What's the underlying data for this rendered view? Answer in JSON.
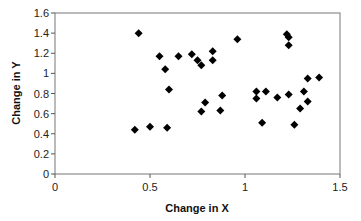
{
  "chart_data": {
    "type": "scatter",
    "title": "",
    "xlabel": "Change in X",
    "ylabel": "Change in Y",
    "xlim": [
      0,
      1.5
    ],
    "ylim": [
      0,
      1.6
    ],
    "xticks": [
      0,
      0.5,
      1,
      1.5
    ],
    "xtick_labels": [
      "0",
      "0.5",
      "1",
      "1.5"
    ],
    "yticks": [
      0,
      0.2,
      0.4,
      0.6,
      0.8,
      1.0,
      1.2,
      1.4,
      1.6
    ],
    "ytick_labels": [
      "0",
      "0.2",
      "0.4",
      "0.6",
      "0.8",
      "1",
      "1.2",
      "1.4",
      "1.6"
    ],
    "grid": false,
    "legend": null,
    "marker": "diamond",
    "marker_color": "#000000",
    "series": [
      {
        "name": "Change",
        "points": [
          [
            0.44,
            1.4
          ],
          [
            0.55,
            1.17
          ],
          [
            0.65,
            1.17
          ],
          [
            0.58,
            1.04
          ],
          [
            0.72,
            1.19
          ],
          [
            0.75,
            1.13
          ],
          [
            0.77,
            1.08
          ],
          [
            0.83,
            1.22
          ],
          [
            0.83,
            1.13
          ],
          [
            0.96,
            1.34
          ],
          [
            1.22,
            1.39
          ],
          [
            1.23,
            1.36
          ],
          [
            1.23,
            1.28
          ],
          [
            1.33,
            0.95
          ],
          [
            1.39,
            0.96
          ],
          [
            1.06,
            0.82
          ],
          [
            1.06,
            0.75
          ],
          [
            1.11,
            0.82
          ],
          [
            1.17,
            0.76
          ],
          [
            1.23,
            0.79
          ],
          [
            1.31,
            0.82
          ],
          [
            1.33,
            0.72
          ],
          [
            1.29,
            0.65
          ],
          [
            1.09,
            0.51
          ],
          [
            1.26,
            0.49
          ],
          [
            0.88,
            0.78
          ],
          [
            0.79,
            0.71
          ],
          [
            0.77,
            0.62
          ],
          [
            0.87,
            0.63
          ],
          [
            0.6,
            0.84
          ],
          [
            0.42,
            0.44
          ],
          [
            0.5,
            0.47
          ],
          [
            0.59,
            0.46
          ]
        ]
      }
    ]
  }
}
